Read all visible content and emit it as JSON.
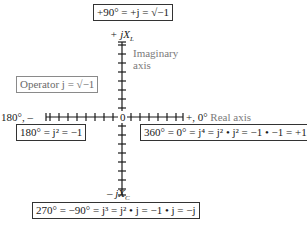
{
  "diagram": {
    "type": "complex-plane-j-operator",
    "top_box": {
      "text": "+90° = +j = √−1"
    },
    "positive_imag_label": {
      "prefix": "+ j",
      "var": "X",
      "sub": "L"
    },
    "imag_axis_label": {
      "line1": "Imaginary",
      "line2": "axis"
    },
    "operator_box": {
      "text": "Operator j = √−1"
    },
    "neg_real_label": {
      "text": "180°, –"
    },
    "origin_label": {
      "text": "0"
    },
    "pos_real_label": {
      "text": "+, 0°"
    },
    "real_axis_label": {
      "text": "Real axis"
    },
    "box_180": {
      "text": "180° = j² = −1"
    },
    "box_360": {
      "text": "360° =  0° = j⁴ = j² • j² = −1 • −1 = +1"
    },
    "negative_imag_label": {
      "prefix": "– j",
      "var": "X",
      "sub": "C"
    },
    "bottom_box": {
      "text": "270° =  −90° = j³ = j² • j = −1 • j = −j"
    },
    "axis": {
      "origin": [
        122,
        117
      ],
      "x_from": 46,
      "x_to": 183,
      "y_from": 42,
      "y_to": 195,
      "tick_spacing": 9,
      "tick_half_length": 4
    },
    "colors": {
      "line": "#1a1a1a",
      "gray_label": "#7a7a7a",
      "gray_border": "#8a8a8a"
    }
  }
}
